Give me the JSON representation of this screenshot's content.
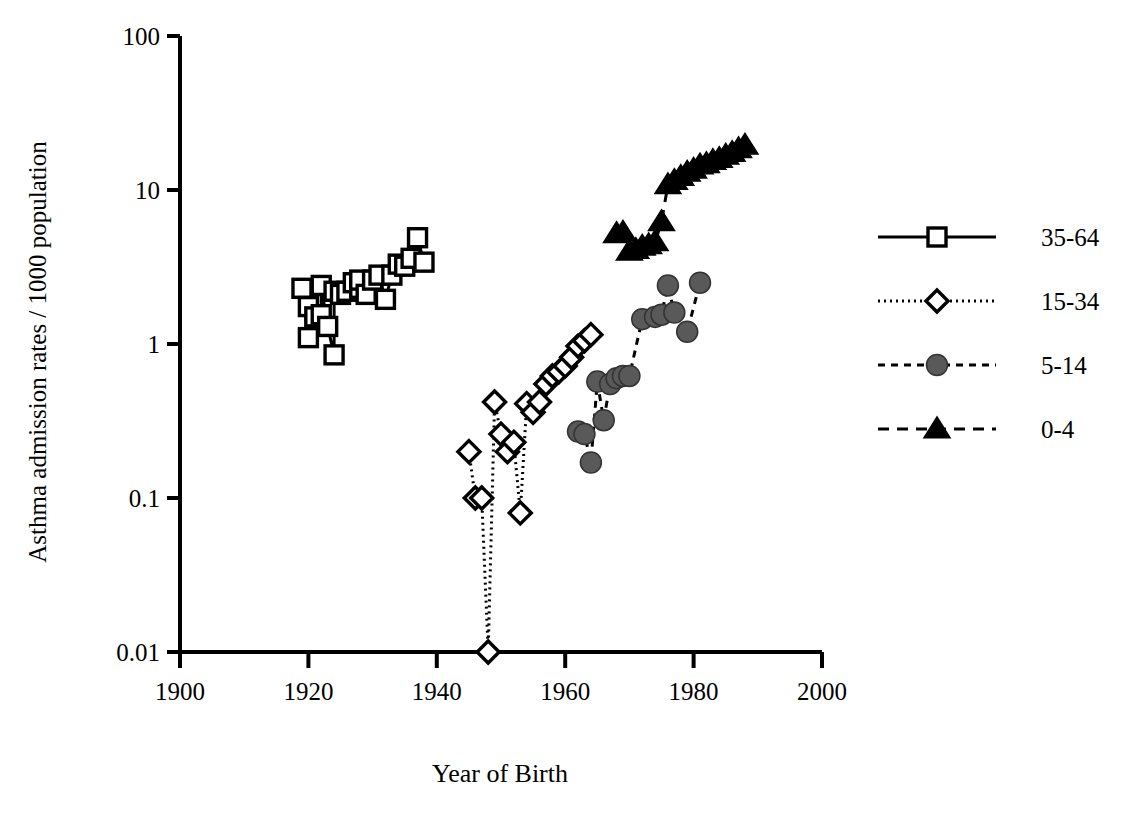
{
  "chart_data": {
    "type": "scatter",
    "title": "",
    "xlabel": "Year of Birth",
    "ylabel": "Asthma admission rates / 1000 population",
    "xlim": [
      1900,
      2000
    ],
    "ylim": [
      0.01,
      100
    ],
    "yscale": "log",
    "grid": false,
    "legend_position": "right",
    "xticks": [
      1900,
      1920,
      1940,
      1960,
      1980,
      2000
    ],
    "xtick_labels": [
      "1900",
      "1920",
      "1940",
      "1960",
      "1980",
      "2000"
    ],
    "yticks": [
      0.01,
      0.1,
      1,
      10,
      100
    ],
    "ytick_labels": [
      "0.01",
      "0.1",
      "1",
      "10",
      "100"
    ],
    "series": [
      {
        "name": "35-64",
        "marker": "open-square",
        "line": "solid",
        "color": "#000000",
        "fill": "#ffffff",
        "x": [
          1919,
          1920,
          1920,
          1921,
          1922,
          1922,
          1923,
          1924,
          1924,
          1925,
          1926,
          1927,
          1928,
          1928,
          1929,
          1930,
          1931,
          1932,
          1933,
          1934,
          1935,
          1936,
          1937,
          1938
        ],
        "y": [
          2.3,
          1.1,
          1.75,
          1.5,
          1.55,
          2.4,
          1.3,
          0.85,
          2.2,
          2.1,
          2.2,
          2.5,
          2.3,
          2.6,
          2.1,
          2.6,
          2.8,
          1.95,
          2.8,
          3.3,
          3.2,
          3.6,
          4.9,
          3.4
        ]
      },
      {
        "name": "15-34",
        "marker": "open-diamond",
        "line": "dotted",
        "color": "#000000",
        "fill": "#ffffff",
        "x": [
          1945,
          1946,
          1947,
          1948,
          1949,
          1950,
          1951,
          1952,
          1953,
          1954,
          1955,
          1956,
          1957,
          1958,
          1959,
          1960,
          1961,
          1962,
          1963,
          1964
        ],
        "y": [
          0.2,
          0.1,
          0.1,
          0.01,
          0.42,
          0.26,
          0.2,
          0.23,
          0.08,
          0.41,
          0.36,
          0.42,
          0.55,
          0.62,
          0.66,
          0.72,
          0.82,
          0.97,
          1.05,
          1.15
        ]
      },
      {
        "name": "5-14",
        "marker": "filled-circle",
        "line": "dashed",
        "color": "#000000",
        "fill": "#595959",
        "x": [
          1962,
          1963,
          1964,
          1965,
          1966,
          1967,
          1968,
          1969,
          1970,
          1972,
          1974,
          1975,
          1976,
          1977,
          1979,
          1981
        ],
        "y": [
          0.27,
          0.26,
          0.17,
          0.57,
          0.32,
          0.55,
          0.6,
          0.62,
          0.62,
          1.45,
          1.5,
          1.55,
          2.4,
          1.6,
          1.2,
          2.5
        ]
      },
      {
        "name": "0-4",
        "marker": "filled-triangle",
        "line": "long-dashed",
        "color": "#000000",
        "fill": "#000000",
        "x": [
          1968,
          1969,
          1970,
          1971,
          1972,
          1973,
          1974,
          1975,
          1976,
          1977,
          1978,
          1979,
          1980,
          1981,
          1982,
          1983,
          1984,
          1985,
          1986,
          1987,
          1988
        ],
        "y": [
          5.2,
          5.3,
          4.0,
          4.1,
          4.3,
          4.4,
          4.6,
          6.2,
          10.8,
          11.5,
          12.2,
          13.0,
          13.6,
          14.5,
          14.8,
          15.5,
          16.0,
          16.8,
          17.5,
          18.5,
          19.5
        ]
      }
    ]
  },
  "legend": {
    "items": [
      {
        "label": "35-64"
      },
      {
        "label": "15-34"
      },
      {
        "label": "5-14"
      },
      {
        "label": "0-4"
      }
    ]
  },
  "axes": {
    "x_title": "Year of Birth",
    "y_title": "Asthma admission rates / 1000 population"
  }
}
